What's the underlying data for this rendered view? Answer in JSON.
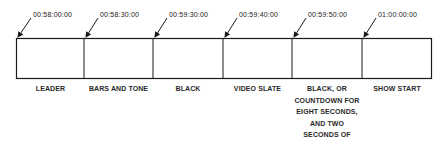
{
  "diagram": {
    "type": "timeline",
    "segments": [
      {
        "label": "LEADER",
        "start_timecode": "00:58:00:00"
      },
      {
        "label": "BARS AND TONE",
        "start_timecode": "00:58:30:00"
      },
      {
        "label": "BLACK",
        "start_timecode": "00:59:30:00"
      },
      {
        "label": "VIDEO SLATE",
        "start_timecode": "00:59:40:00"
      },
      {
        "label": "BLACK, OR COUNTDOWN FOR EIGHT SECONDS, AND TWO SECONDS OF BLACK.",
        "label_lines": [
          "BLACK, OR",
          "COUNTDOWN FOR",
          "EIGHT SECONDS,",
          "AND TWO",
          "SECONDS OF",
          "BLACK."
        ],
        "start_timecode": "00:59:50:00"
      },
      {
        "label": "SHOW START",
        "start_timecode": "01:00:00:00"
      }
    ],
    "colors": {
      "line": "#1a1a1a",
      "background": "#ffffff"
    }
  }
}
